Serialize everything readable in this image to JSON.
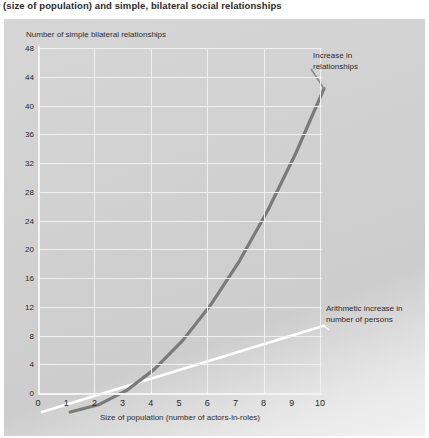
{
  "caption": "(size of population) and simple, bilateral social relationships",
  "chart_data": {
    "type": "line",
    "title": "",
    "ylabel": "Number of simple bilateral relationships",
    "xlabel": "Size of population (number of actors-in-roles)",
    "xlim": [
      0,
      10
    ],
    "ylim": [
      0,
      48
    ],
    "xticks": [
      "0",
      "1",
      "2",
      "3",
      "4",
      "5",
      "6",
      "7",
      "8",
      "9",
      "10"
    ],
    "yticks": [
      "0",
      "4",
      "8",
      "12",
      "16",
      "20",
      "24",
      "28",
      "32",
      "36",
      "40",
      "44",
      "48"
    ],
    "grid": true,
    "grid_color": "#f0f0f0",
    "plot_background": "#d2d2d2",
    "legend_position": "inline-annotations",
    "series": [
      {
        "name": "Increase in relationships",
        "color": "#7a7a7a",
        "x": [
          1,
          2,
          3,
          4,
          5,
          6,
          7,
          8,
          9,
          10
        ],
        "values": [
          0,
          1,
          3,
          6,
          10,
          15,
          21,
          28,
          36,
          45
        ],
        "annotation": "Increase in\nrelationships"
      },
      {
        "name": "Arithmetic increase in number of persons",
        "color": "#ffffff",
        "x": [
          0,
          10
        ],
        "values": [
          0,
          12
        ],
        "annotation": "Arithmetic increase in\nnumber of persons"
      }
    ],
    "annotations": [
      {
        "id": "increase-relationships",
        "line1": "Increase in",
        "line2": "relationships"
      },
      {
        "id": "arithmetic-increase",
        "line1": "Arithmetic increase in",
        "line2": "number of persons"
      }
    ]
  }
}
